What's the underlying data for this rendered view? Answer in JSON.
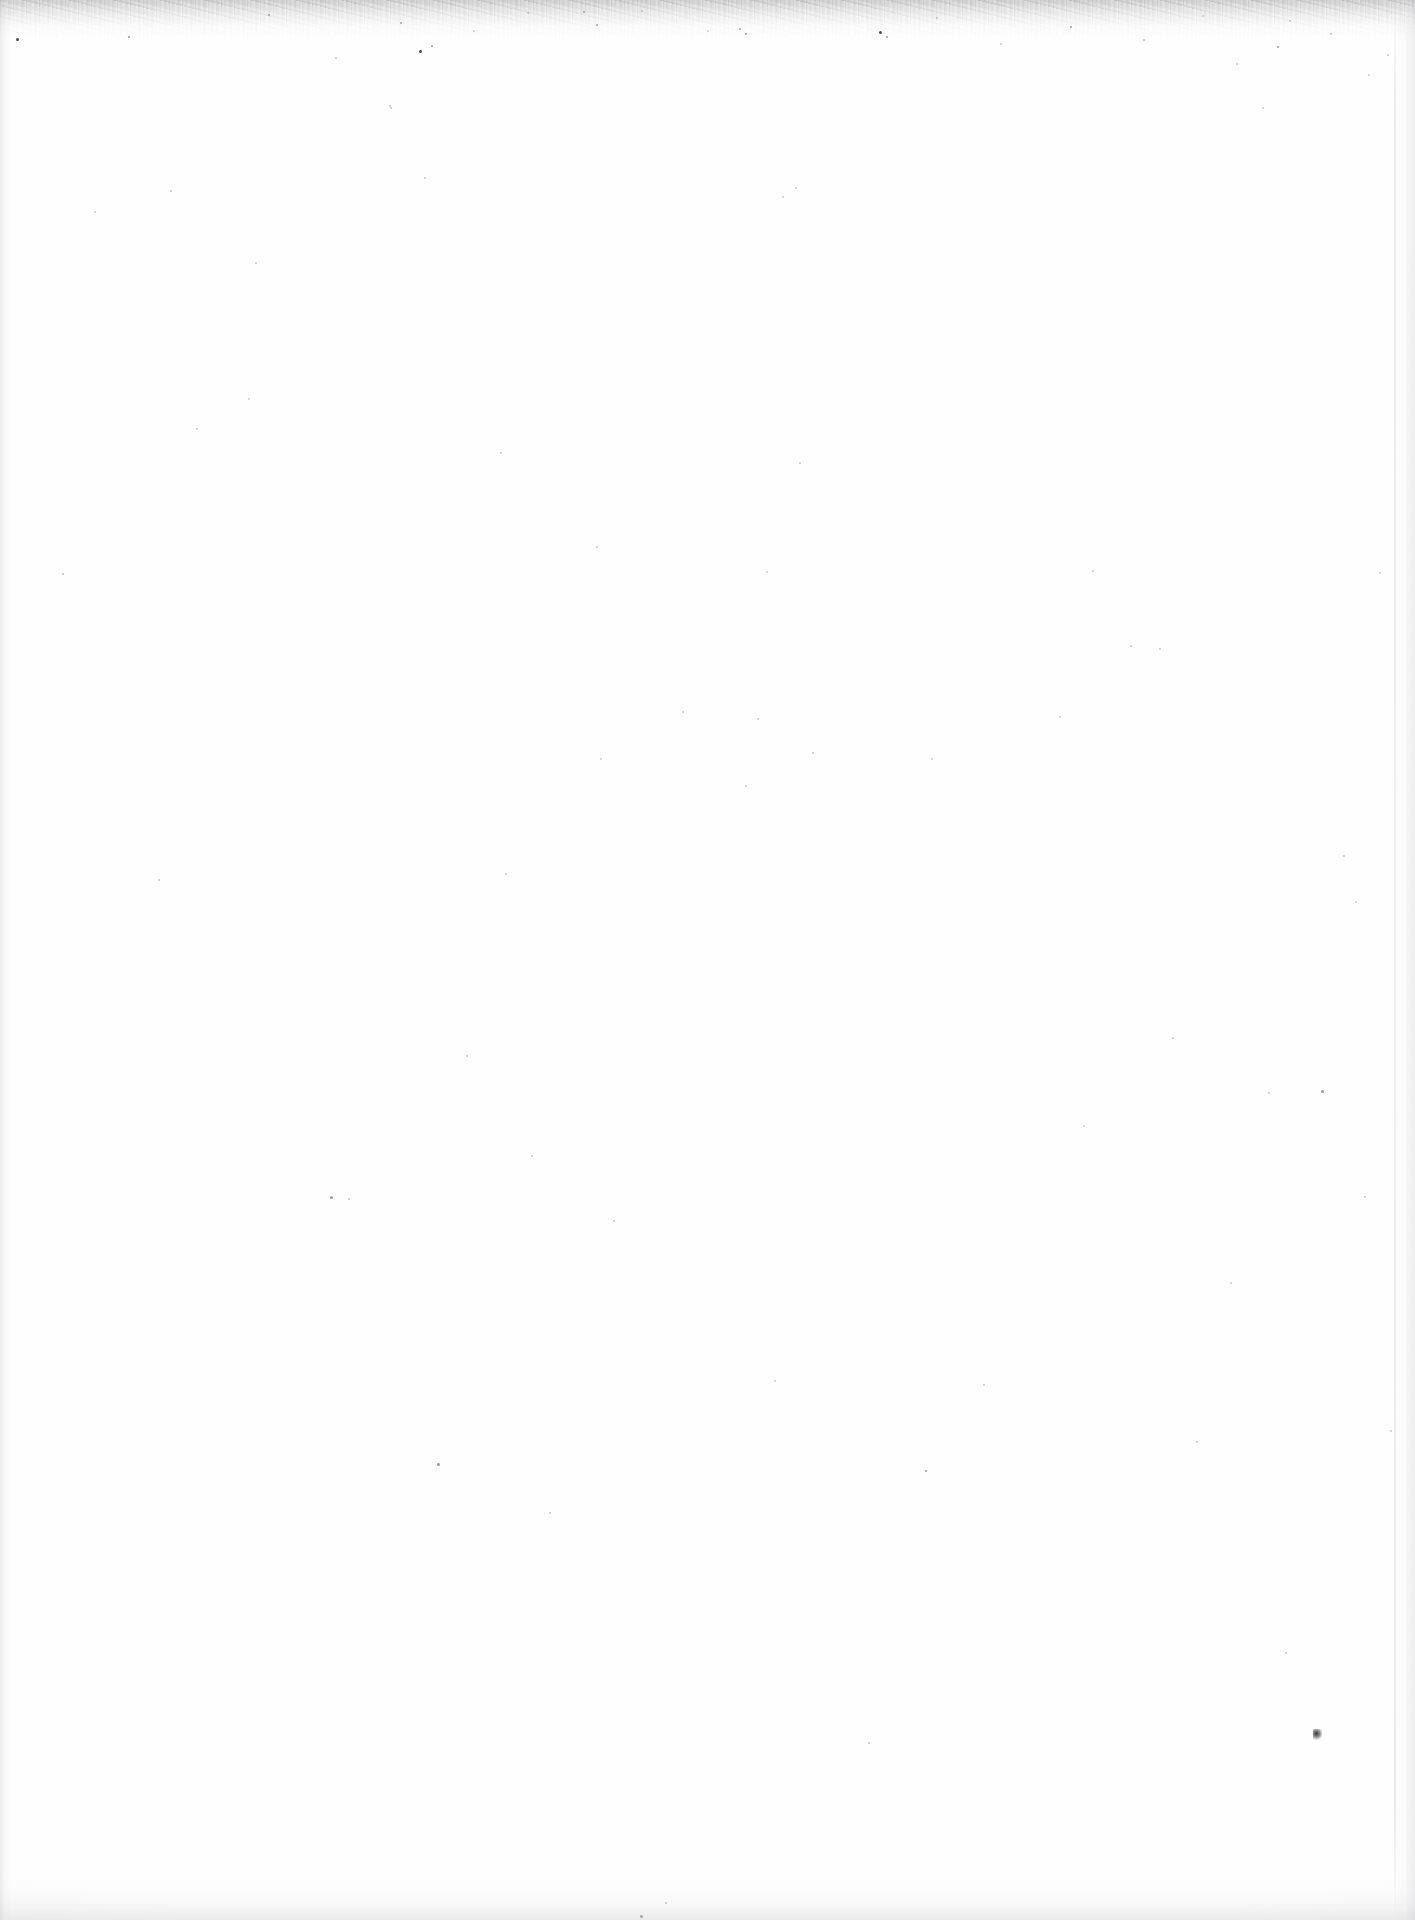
{
  "document": {
    "kind": "scanned-page",
    "page_state": "blank",
    "visible_text": "",
    "headings": [],
    "paragraphs": [],
    "figures": [],
    "tables": [],
    "page_number": "",
    "header_text": "",
    "footer_text": "",
    "marginalia": []
  },
  "scan": {
    "paper_color": "#fefefe",
    "background_color": "#ffffff",
    "edge_shadow_color": "#b6b6ba",
    "speckle_color": "#6e6e72",
    "debris_color": "#2a2a2e",
    "width_px": 1415,
    "height_px": 1920
  },
  "artifacts": {
    "top_speckle_band": "scanner grain along top edge",
    "left_edge_band": "page edge shadow (left)",
    "right_edge_band": "page edge shadow (right)",
    "bottom_edge_band": "page edge shadow (bottom)",
    "debris_mark": "dark dust speck, lower right"
  },
  "specks": [
    {
      "x": 16,
      "y": 38,
      "s": 3,
      "t": "dark"
    },
    {
      "x": 128,
      "y": 36,
      "s": 2,
      "t": "mid"
    },
    {
      "x": 268,
      "y": 14,
      "s": 2,
      "t": "mid"
    },
    {
      "x": 335,
      "y": 57,
      "s": 2,
      "t": "faint"
    },
    {
      "x": 389,
      "y": 105,
      "s": 2,
      "t": "faint"
    },
    {
      "x": 400,
      "y": 22,
      "s": 2,
      "t": "mid"
    },
    {
      "x": 419,
      "y": 50,
      "s": 3,
      "t": "dark"
    },
    {
      "x": 431,
      "y": 45,
      "s": 2,
      "t": "mid"
    },
    {
      "x": 473,
      "y": 30,
      "s": 2,
      "t": "faint"
    },
    {
      "x": 527,
      "y": 12,
      "s": 2,
      "t": "faint"
    },
    {
      "x": 596,
      "y": 24,
      "s": 2,
      "t": "mid"
    },
    {
      "x": 641,
      "y": 10,
      "s": 2,
      "t": "faint"
    },
    {
      "x": 707,
      "y": 30,
      "s": 2,
      "t": "faint"
    },
    {
      "x": 739,
      "y": 28,
      "s": 2,
      "t": "mid"
    },
    {
      "x": 745,
      "y": 33,
      "s": 2,
      "t": "mid"
    },
    {
      "x": 782,
      "y": 196,
      "s": 2,
      "t": "faint"
    },
    {
      "x": 795,
      "y": 187,
      "s": 2,
      "t": "faint"
    },
    {
      "x": 879,
      "y": 31,
      "s": 3,
      "t": "dark"
    },
    {
      "x": 886,
      "y": 36,
      "s": 2,
      "t": "mid"
    },
    {
      "x": 936,
      "y": 17,
      "s": 2,
      "t": "faint"
    },
    {
      "x": 1000,
      "y": 43,
      "s": 2,
      "t": "faint"
    },
    {
      "x": 1070,
      "y": 26,
      "s": 2,
      "t": "mid"
    },
    {
      "x": 1092,
      "y": 570,
      "s": 2,
      "t": "faint"
    },
    {
      "x": 1143,
      "y": 39,
      "s": 2,
      "t": "faint"
    },
    {
      "x": 1202,
      "y": 15,
      "s": 2,
      "t": "faint"
    },
    {
      "x": 1236,
      "y": 63,
      "s": 2,
      "t": "faint"
    },
    {
      "x": 1262,
      "y": 107,
      "s": 2,
      "t": "faint"
    },
    {
      "x": 1277,
      "y": 46,
      "s": 2,
      "t": "mid"
    },
    {
      "x": 1289,
      "y": 20,
      "s": 2,
      "t": "faint"
    },
    {
      "x": 1330,
      "y": 33,
      "s": 2,
      "t": "faint"
    },
    {
      "x": 1368,
      "y": 74,
      "s": 2,
      "t": "faint"
    },
    {
      "x": 1387,
      "y": 54,
      "s": 2,
      "t": "faint"
    },
    {
      "x": 62,
      "y": 573,
      "s": 2,
      "t": "faint"
    },
    {
      "x": 94,
      "y": 211,
      "s": 2,
      "t": "faint"
    },
    {
      "x": 158,
      "y": 879,
      "s": 2,
      "t": "faint"
    },
    {
      "x": 170,
      "y": 190,
      "s": 2,
      "t": "faint"
    },
    {
      "x": 196,
      "y": 428,
      "s": 2,
      "t": "faint"
    },
    {
      "x": 248,
      "y": 398,
      "s": 2,
      "t": "faint"
    },
    {
      "x": 255,
      "y": 262,
      "s": 2,
      "t": "faint"
    },
    {
      "x": 330,
      "y": 1196,
      "s": 3,
      "t": "mid"
    },
    {
      "x": 348,
      "y": 1198,
      "s": 2,
      "t": "faint"
    },
    {
      "x": 390,
      "y": 107,
      "s": 2,
      "t": "faint"
    },
    {
      "x": 424,
      "y": 177,
      "s": 2,
      "t": "faint"
    },
    {
      "x": 437,
      "y": 1463,
      "s": 3,
      "t": "mid"
    },
    {
      "x": 466,
      "y": 1055,
      "s": 2,
      "t": "faint"
    },
    {
      "x": 500,
      "y": 452,
      "s": 2,
      "t": "faint"
    },
    {
      "x": 505,
      "y": 873,
      "s": 2,
      "t": "faint"
    },
    {
      "x": 531,
      "y": 1155,
      "s": 2,
      "t": "faint"
    },
    {
      "x": 549,
      "y": 1512,
      "s": 2,
      "t": "faint"
    },
    {
      "x": 583,
      "y": 11,
      "s": 2,
      "t": "mid"
    },
    {
      "x": 596,
      "y": 546,
      "s": 2,
      "t": "faint"
    },
    {
      "x": 600,
      "y": 758,
      "s": 2,
      "t": "faint"
    },
    {
      "x": 613,
      "y": 1220,
      "s": 2,
      "t": "faint"
    },
    {
      "x": 640,
      "y": 1915,
      "s": 3,
      "t": "mid"
    },
    {
      "x": 665,
      "y": 1902,
      "s": 2,
      "t": "faint"
    },
    {
      "x": 682,
      "y": 711,
      "s": 2,
      "t": "faint"
    },
    {
      "x": 745,
      "y": 785,
      "s": 2,
      "t": "faint"
    },
    {
      "x": 757,
      "y": 718,
      "s": 2,
      "t": "faint"
    },
    {
      "x": 766,
      "y": 571,
      "s": 2,
      "t": "faint"
    },
    {
      "x": 774,
      "y": 1380,
      "s": 2,
      "t": "faint"
    },
    {
      "x": 799,
      "y": 462,
      "s": 2,
      "t": "faint"
    },
    {
      "x": 812,
      "y": 752,
      "s": 2,
      "t": "faint"
    },
    {
      "x": 868,
      "y": 1742,
      "s": 2,
      "t": "faint"
    },
    {
      "x": 925,
      "y": 1470,
      "s": 2,
      "t": "mid"
    },
    {
      "x": 931,
      "y": 758,
      "s": 2,
      "t": "faint"
    },
    {
      "x": 983,
      "y": 1384,
      "s": 2,
      "t": "faint"
    },
    {
      "x": 1059,
      "y": 716,
      "s": 2,
      "t": "faint"
    },
    {
      "x": 1083,
      "y": 1125,
      "s": 2,
      "t": "faint"
    },
    {
      "x": 1130,
      "y": 645,
      "s": 2,
      "t": "faint"
    },
    {
      "x": 1159,
      "y": 648,
      "s": 2,
      "t": "faint"
    },
    {
      "x": 1172,
      "y": 1037,
      "s": 2,
      "t": "faint"
    },
    {
      "x": 1196,
      "y": 1441,
      "s": 2,
      "t": "faint"
    },
    {
      "x": 1230,
      "y": 1282,
      "s": 2,
      "t": "faint"
    },
    {
      "x": 1268,
      "y": 1092,
      "s": 2,
      "t": "faint"
    },
    {
      "x": 1285,
      "y": 1652,
      "s": 2,
      "t": "faint"
    },
    {
      "x": 1321,
      "y": 1090,
      "s": 3,
      "t": "mid"
    },
    {
      "x": 1343,
      "y": 855,
      "s": 2,
      "t": "faint"
    },
    {
      "x": 1355,
      "y": 901,
      "s": 2,
      "t": "faint"
    },
    {
      "x": 1364,
      "y": 1196,
      "s": 2,
      "t": "faint"
    },
    {
      "x": 1379,
      "y": 572,
      "s": 2,
      "t": "faint"
    },
    {
      "x": 1390,
      "y": 1430,
      "s": 2,
      "t": "faint"
    }
  ],
  "debris": {
    "x": 1313,
    "y": 1729
  }
}
